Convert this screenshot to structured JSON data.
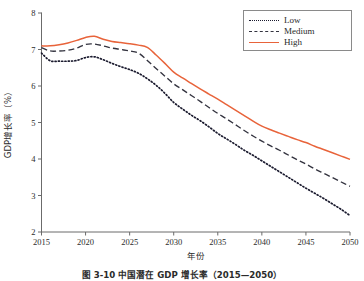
{
  "figure": {
    "caption": "图 3-10  中国潜在 GDP 增长率（2015—2050）"
  },
  "legend": {
    "items": [
      {
        "label": "Low",
        "style": "dotted",
        "color": "#1a1a2e"
      },
      {
        "label": "Medium",
        "style": "dashed",
        "color": "#33333f"
      },
      {
        "label": "High",
        "style": "solid",
        "color": "#e8633a"
      }
    ]
  },
  "chart_data": {
    "type": "line",
    "title": "",
    "xlabel": "年份",
    "ylabel": "GDP增长率（%）",
    "xlim": [
      2015,
      2050
    ],
    "ylim": [
      2,
      8
    ],
    "xticks": [
      2015,
      2020,
      2025,
      2030,
      2035,
      2040,
      2045,
      2050
    ],
    "yticks": [
      2,
      3,
      4,
      5,
      6,
      7,
      8
    ],
    "grid": false,
    "legend_position": "upper-right",
    "x": [
      2015,
      2016,
      2017,
      2018,
      2019,
      2020,
      2021,
      2022,
      2023,
      2024,
      2025,
      2026,
      2027,
      2028,
      2029,
      2030,
      2031,
      2032,
      2033,
      2034,
      2035,
      2036,
      2037,
      2038,
      2039,
      2040,
      2041,
      2042,
      2043,
      2044,
      2045,
      2046,
      2047,
      2048,
      2049,
      2050
    ],
    "series": [
      {
        "name": "Low",
        "color": "#1a1a2e",
        "style": "dotted",
        "values": [
          6.9,
          6.69,
          6.68,
          6.68,
          6.7,
          6.78,
          6.8,
          6.72,
          6.62,
          6.53,
          6.45,
          6.35,
          6.2,
          6.02,
          5.8,
          5.55,
          5.37,
          5.2,
          5.05,
          4.88,
          4.7,
          4.55,
          4.4,
          4.24,
          4.1,
          3.95,
          3.8,
          3.65,
          3.5,
          3.35,
          3.2,
          3.06,
          2.92,
          2.77,
          2.62,
          2.45
        ]
      },
      {
        "name": "Medium",
        "color": "#33333f",
        "style": "dashed",
        "values": [
          7.05,
          6.96,
          6.96,
          6.98,
          7.04,
          7.14,
          7.15,
          7.1,
          7.04,
          7.0,
          6.96,
          6.9,
          6.7,
          6.48,
          6.27,
          6.06,
          5.9,
          5.74,
          5.58,
          5.41,
          5.25,
          5.1,
          4.94,
          4.78,
          4.63,
          4.49,
          4.36,
          4.24,
          4.11,
          3.98,
          3.86,
          3.73,
          3.61,
          3.49,
          3.37,
          3.25
        ]
      },
      {
        "name": "High",
        "color": "#e8633a",
        "style": "solid",
        "values": [
          7.1,
          7.1,
          7.13,
          7.18,
          7.25,
          7.33,
          7.36,
          7.28,
          7.22,
          7.19,
          7.16,
          7.12,
          7.06,
          6.85,
          6.62,
          6.38,
          6.22,
          6.07,
          5.92,
          5.78,
          5.64,
          5.49,
          5.34,
          5.19,
          5.04,
          4.9,
          4.8,
          4.71,
          4.62,
          4.53,
          4.45,
          4.35,
          4.26,
          4.17,
          4.08,
          3.99
        ]
      }
    ]
  }
}
